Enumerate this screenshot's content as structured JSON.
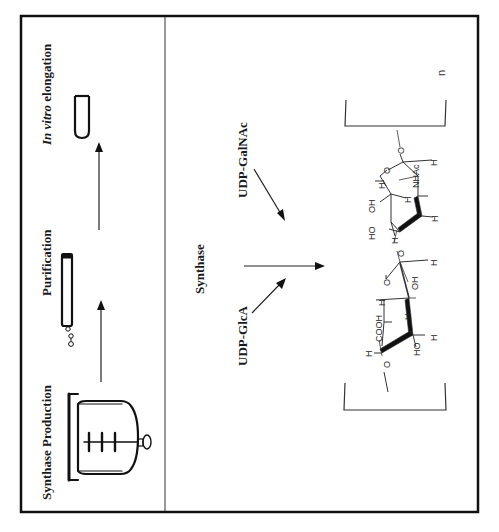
{
  "figure": {
    "panel_top": {
      "steps": [
        {
          "label_italic": "",
          "label": "Synthase Production",
          "icon": "bioreactor-icon"
        },
        {
          "label_italic": "",
          "label": "Purification",
          "icon": "chromatography-column-icon"
        },
        {
          "label_italic": "In vitro",
          "label": " elongation",
          "icon": "test-tube-icon"
        }
      ]
    },
    "panel_bottom": {
      "enzyme_label": "Synthase",
      "substrate_1": "UDP-GlcA",
      "substrate_2": "UDP-GalNAc",
      "repeat_subscript": "n",
      "atoms": {
        "glca_cooh": "COOH",
        "glca_ho": "HO",
        "glca_oh": "OH",
        "galnac_ho": "HO",
        "galnac_oh": "OH",
        "galnac_nhac": "NHAc",
        "ring_o": "O",
        "link_o": "O",
        "h": "H"
      }
    }
  }
}
